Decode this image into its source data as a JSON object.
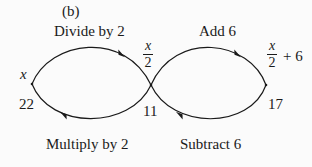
{
  "panel_label": "(b)",
  "colors": {
    "background": "#fbfbfb",
    "stroke": "#1a1a1a"
  },
  "nodes": {
    "left": {
      "expr": "x",
      "value": "22"
    },
    "center": {
      "expr_num": "x",
      "expr_den": "2",
      "value": "11"
    },
    "right": {
      "expr_num": "x",
      "expr_den": "2",
      "expr_suffix": "+ 6",
      "value": "17"
    }
  },
  "operations": {
    "top_left": "Divide by 2",
    "top_right": "Add 6",
    "bottom_left": "Multiply by 2",
    "bottom_right": "Subtract 6"
  }
}
